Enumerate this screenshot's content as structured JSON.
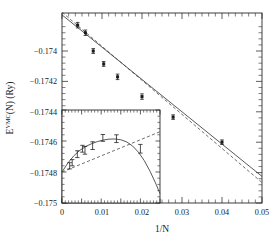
{
  "figure": {
    "background": "#ffffff",
    "ink_color": "#1a1a1a"
  },
  "chart_data": {
    "type": "scatter",
    "title": "",
    "subtitle": "",
    "xlabel": "1/N",
    "ylabel_parts": {
      "base": "E",
      "superscript": "VMC",
      "argument": "(N)",
      "units": "(Ry)"
    },
    "ylabel": "E^VMC(N) (Ry)",
    "xlim": [
      0,
      0.05
    ],
    "ylim": [
      -0.175,
      -0.17375
    ],
    "grid": false,
    "legend": null,
    "xticks": [
      0,
      0.01,
      0.02,
      0.03,
      0.04,
      0.05
    ],
    "xticklabels": [
      "0",
      "0.01",
      "0.02",
      "0.03",
      "0.04",
      "0.05"
    ],
    "x_minor_per_interval": 5,
    "yticks": [
      -0.174,
      -0.1742,
      -0.1744,
      -0.1746,
      -0.1748,
      -0.175
    ],
    "yticklabels": [
      "-0.174",
      "-0.1742",
      "-0.1744",
      "-0.1746",
      "-0.1748",
      "-0.175"
    ],
    "y_minor_per_interval": 4,
    "series": [
      {
        "name": "data-points",
        "type": "scatter",
        "marker": "filled-square",
        "x": [
          0.00391,
          0.00586,
          0.00781,
          0.01042,
          0.01389,
          0.02,
          0.02778,
          0.04
        ],
        "y": [
          -0.17383,
          -0.17388,
          -0.174,
          -0.174085,
          -0.17417,
          -0.1743,
          -0.174435,
          -0.1746
        ],
        "yerr": [
          1.8e-05,
          1.8e-05,
          1.6e-05,
          1.6e-05,
          1.8e-05,
          1.8e-05,
          1.5e-05,
          1.5e-05
        ]
      },
      {
        "name": "fit-solid",
        "type": "line",
        "style": "solid",
        "x": [
          0.0,
          0.05
        ],
        "y": [
          -0.1737625,
          -0.174825
        ]
      },
      {
        "name": "fit-dashed",
        "type": "line",
        "style": "dashed",
        "x": [
          0.0,
          0.05
        ],
        "y": [
          -0.173745,
          -0.174865
        ]
      }
    ],
    "inset": {
      "type": "scatter",
      "xlim": [
        0,
        0.025
      ],
      "ylim": [
        -0.175,
        -0.1744
      ],
      "xlabel": "",
      "ylabel": "",
      "grid": false,
      "x_minor_per_interval": 5,
      "y_minor_per_interval": 4,
      "series": [
        {
          "name": "inset-data-points",
          "type": "scatter",
          "marker": "error-bar",
          "x": [
            0.00195,
            0.0026,
            0.00391,
            0.00521,
            0.00586,
            0.00781,
            0.01042,
            0.01389,
            0.02
          ],
          "y": [
            -0.17476,
            -0.17474,
            -0.174685,
            -0.17465,
            -0.17466,
            -0.17463,
            -0.17458,
            -0.174585,
            -0.17465
          ],
          "yerr": [
            2e-05,
            2e-05,
            2.2e-05,
            2.2e-05,
            2.5e-05,
            2.5e-05,
            2.2e-05,
            2.5e-05,
            2.8e-05
          ]
        },
        {
          "name": "inset-fit-solid",
          "type": "line",
          "style": "solid",
          "x": [
            0.0,
            0.0015,
            0.003,
            0.0045,
            0.006,
            0.0075,
            0.009,
            0.0105,
            0.012,
            0.0135,
            0.015,
            0.0165,
            0.018,
            0.0195,
            0.021,
            0.0225,
            0.024,
            0.025
          ],
          "y": [
            -0.1748,
            -0.174742,
            -0.174696,
            -0.174661,
            -0.174636,
            -0.174618,
            -0.174604,
            -0.174594,
            -0.174588,
            -0.174587,
            -0.174592,
            -0.174606,
            -0.174632,
            -0.174672,
            -0.174727,
            -0.174797,
            -0.174879,
            -0.17494
          ]
        },
        {
          "name": "inset-fit-dashed",
          "type": "line",
          "style": "dashed",
          "x": [
            0.0,
            0.025
          ],
          "y": [
            -0.1748,
            -0.17454
          ]
        }
      ]
    }
  }
}
